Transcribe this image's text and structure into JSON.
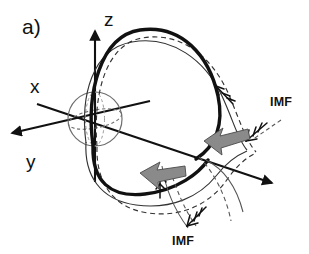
{
  "figure": {
    "panel_label": "a)",
    "background_color": "#ffffff",
    "ink_color": "#111111",
    "accent_gray": "#7f7f7f"
  },
  "axes": {
    "items": [
      {
        "name": "x",
        "label": "x",
        "direction": "down-right",
        "label_x": 30,
        "label_y": 93
      },
      {
        "name": "y",
        "label": "y",
        "direction": "left",
        "label_x": 26,
        "label_y": 168
      },
      {
        "name": "z",
        "label": "z",
        "direction": "up",
        "label_x": 104,
        "label_y": 26
      }
    ]
  },
  "body": {
    "name": "earth-sphere",
    "center_x": 95,
    "center_y": 119,
    "radius": 27
  },
  "labels": {
    "imf_upper": {
      "text": "IMF",
      "x": 270,
      "y": 106
    },
    "imf_lower": {
      "text": "IMF",
      "x": 191,
      "y": 240
    }
  },
  "field_lines": {
    "styles": [
      "thick-solid",
      "thin-solid",
      "dashed"
    ],
    "arrow_markers": 4,
    "flow_arrows": [
      {
        "name": "flow-arrow-upper",
        "direction": "left",
        "color": "#7f7f7f"
      },
      {
        "name": "flow-arrow-lower",
        "direction": "left",
        "color": "#7f7f7f"
      }
    ]
  }
}
